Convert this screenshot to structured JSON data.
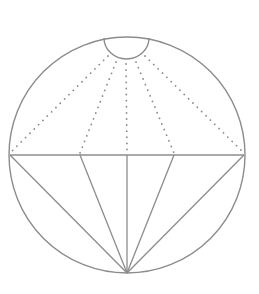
{
  "diagram": {
    "title": "",
    "stroke_color": "#8c8c8c",
    "dot_color": "#8c8c8c",
    "circle": {
      "cx": 127,
      "cy": 155,
      "r": 118
    },
    "top_semicircle": {
      "x1": 104,
      "x2": 149,
      "y": 38,
      "bottom_y": 59
    },
    "chord": {
      "y": 155,
      "x1": 10,
      "x2": 244
    },
    "apex": {
      "x": 127,
      "y": 273
    },
    "chord_points_x": [
      10,
      80,
      127,
      174,
      244
    ],
    "dotted_origins": [
      {
        "x": 108,
        "y": 56
      },
      {
        "x": 116,
        "y": 62
      },
      {
        "x": 126,
        "y": 64
      },
      {
        "x": 136,
        "y": 62
      },
      {
        "x": 145,
        "y": 56
      }
    ]
  }
}
